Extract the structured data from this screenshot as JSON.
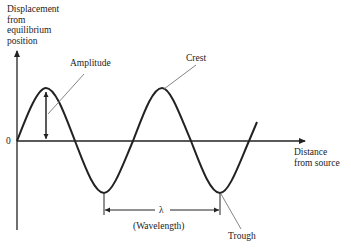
{
  "diagram": {
    "type": "transverse-wave",
    "y_axis_label": [
      "Displacement",
      "from",
      "equilibrium",
      "position"
    ],
    "x_axis_label": [
      "Distance",
      "from source"
    ],
    "origin_label": "0",
    "annotations": {
      "amplitude": "Amplitude",
      "crest": "Crest",
      "trough": "Trough",
      "lambda": "λ",
      "wavelength": "(Wavelength)"
    },
    "colors": {
      "wave": "#222222",
      "axes": "#222222",
      "leader": "#777777",
      "text": "#222222"
    }
  }
}
